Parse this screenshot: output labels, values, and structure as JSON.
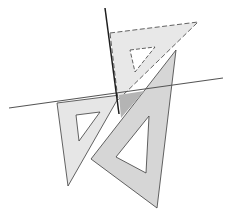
{
  "diagram": {
    "colors": {
      "background": "#ffffff",
      "set_square_light": "#e6e6e6",
      "set_square_mid": "#d2d2d2",
      "overlap_dark": "#b4b4b4",
      "outline": "#3c3c3c",
      "line": "#555555",
      "perpendicular_line": "#1e1e1e",
      "hole": "#ffffff"
    },
    "elements": {
      "horizontal_line": {
        "x1": 9,
        "y1": 108,
        "x2": 223,
        "y2": 78
      },
      "vertical_line": {
        "x1": 105,
        "y1": 8,
        "x2": 119,
        "y2": 114
      },
      "top_set_square": {
        "points": "110,33 198,22 118,100",
        "hole": "130,50 155,47 135,72",
        "style": "dashed"
      },
      "left_set_square": {
        "points": "57,103 120,95 68,186",
        "hole": "76,115 100,112 79,141"
      },
      "right_set_square": {
        "points": "176,50 91,159 157,208",
        "hole": "149,116 146,173 116,157"
      },
      "overlap_region": {
        "points": "119,95 144,91 121,118"
      }
    }
  }
}
